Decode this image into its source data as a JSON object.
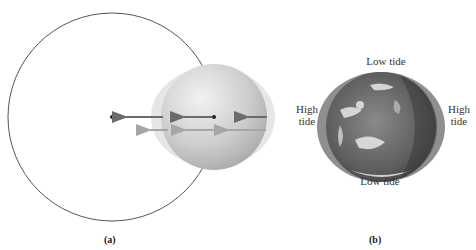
{
  "panels": [
    {
      "id": "a",
      "caption": "(a)",
      "description": "Moon orbit circle with Earth and differential gravitational force arrows"
    },
    {
      "id": "b",
      "caption": "(b)",
      "labels": {
        "top": "Low tide",
        "bottom": "Low tide",
        "left_line1": "High",
        "left_line2": "tide",
        "right_line1": "High",
        "right_line2": "tide"
      }
    }
  ],
  "colors": {
    "orbit_stroke": "#555555",
    "earth_fill": "#cfcfcf",
    "bulge_fill": "#e4e4e4",
    "arrow_dark": "#6b6b6b",
    "arrow_light": "#a6a6a6",
    "globe_ocean": "#6a6a6a",
    "globe_bulge": "#9a9a9a"
  }
}
